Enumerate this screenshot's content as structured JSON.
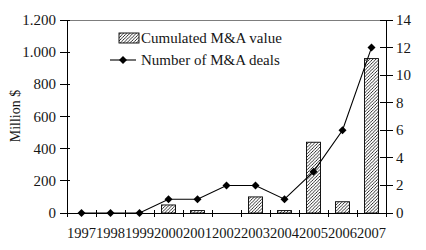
{
  "chart_data": {
    "type": "combo",
    "categories": [
      "1997",
      "1998",
      "1999",
      "2000",
      "2001",
      "2002",
      "2003",
      "2004",
      "2005",
      "2006",
      "2007"
    ],
    "series": [
      {
        "name": "Cumulated M&A value",
        "type": "bar",
        "axis": "left",
        "fill": "diagonal-hatch",
        "color": "#000000",
        "values": [
          0,
          0,
          0,
          50,
          15,
          0,
          100,
          15,
          440,
          70,
          960
        ]
      },
      {
        "name": "Number of M&A deals",
        "type": "line",
        "axis": "right",
        "marker": "diamond",
        "color": "#000000",
        "values": [
          0,
          0,
          0,
          1,
          1,
          2,
          2,
          1,
          3,
          6,
          12
        ]
      }
    ],
    "left_axis": {
      "label": "Million $",
      "min": 0,
      "max": 1200,
      "step": 200,
      "tick_labels": [
        "0",
        "200",
        "400",
        "600",
        "800",
        "1.000",
        "1.200"
      ]
    },
    "right_axis": {
      "min": 0,
      "max": 14,
      "step": 2,
      "tick_labels": [
        "0",
        "2",
        "4",
        "6",
        "8",
        "10",
        "12",
        "14"
      ]
    },
    "legend": {
      "position": "top-center",
      "entries": [
        "Cumulated M&A value",
        "Number of M&A deals"
      ]
    },
    "grid": "top-border-only",
    "colors": {
      "axis": "#000000",
      "top_border": "#7d7d7d",
      "text": "#161616",
      "bar_stroke": "#000000",
      "line": "#000000"
    }
  }
}
